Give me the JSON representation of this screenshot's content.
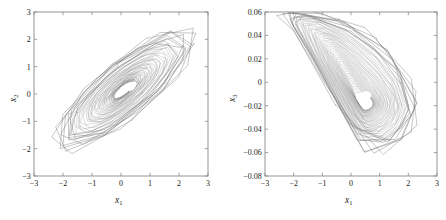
{
  "figure": {
    "background_color": "#ffffff",
    "trace_color": "#6e6e6e",
    "axis_color": "#8a8a8a",
    "panels": [
      "left",
      "right"
    ]
  },
  "chart_data": [
    {
      "type": "line",
      "name": "phase-portrait-x1-x2",
      "title": "",
      "xlabel": "x1",
      "ylabel": "x2",
      "xlim": [
        -3,
        3
      ],
      "ylim": [
        -3,
        3
      ],
      "xticks": [
        -3,
        -2,
        -1,
        0,
        1,
        2,
        3
      ],
      "yticks": [
        -3,
        -2,
        -1,
        0,
        1,
        2,
        3
      ],
      "xticklabels": [
        "-3",
        "-2",
        "-1",
        "0",
        "1",
        "2",
        "3"
      ],
      "yticklabels": [
        "-3",
        "-2",
        "-1",
        "0",
        "1",
        "2",
        "3"
      ],
      "grid": false,
      "legend": null,
      "description": "Chaotic attractor trajectory, elongated ellipse tilted at about 45 degrees from lower-left (-2.2,-2.0) to upper-right (2.6,2.4), with a small white void near (0.35,0.25)",
      "attractor": {
        "center": [
          0.1,
          0.15
        ],
        "void_center": [
          0.38,
          0.28
        ],
        "void_size": [
          0.22,
          0.42
        ],
        "tilt_deg": 42,
        "outer_semi_major": 3.3,
        "outer_semi_minor": 1.05,
        "inner_semi_major": 0.45,
        "inner_semi_minor": 0.16,
        "loops": 46,
        "points_per_loop": 15,
        "polygonal_jitter": 0.12
      }
    },
    {
      "type": "line",
      "name": "phase-portrait-x1-x3",
      "title": "",
      "xlabel": "x1",
      "ylabel": "x3",
      "xlim": [
        -3,
        3
      ],
      "ylim": [
        -0.08,
        0.06
      ],
      "xticks": [
        -3,
        -2,
        -1,
        0,
        1,
        2,
        3
      ],
      "yticks": [
        -0.08,
        -0.06,
        -0.04,
        -0.02,
        0,
        0.02,
        0.04,
        0.06
      ],
      "xticklabels": [
        "-3",
        "-2",
        "-1",
        "0",
        "1",
        "2",
        "3"
      ],
      "yticklabels": [
        "-0.08",
        "-0.06",
        "-0.04",
        "-0.02",
        "0",
        "0.02",
        "0.04",
        "0.06"
      ],
      "grid": false,
      "legend": null,
      "description": "Chaotic attractor with a narrow funnel tail reaching the upper-left corner near (-2.1,0.058) and a broad swirl body centred near (0.4,-0.02), spanning x from -2.1 to 2.6 and x3 from -0.066 to 0.058",
      "attractor": {
        "body_center": [
          0.45,
          -0.018
        ],
        "void_center": [
          0.45,
          -0.012
        ],
        "void_size": [
          0.55,
          0.008
        ],
        "tail_tip": [
          -2.15,
          0.058
        ],
        "tail_width": 0.012,
        "outer_radius_x": 2.0,
        "outer_radius_y": 0.046,
        "inner_radius_x": 0.32,
        "inner_radius_y": 0.006,
        "loops": 46,
        "points_per_loop": 15,
        "polygonal_jitter": 0.1
      }
    }
  ]
}
